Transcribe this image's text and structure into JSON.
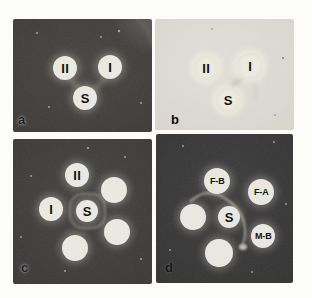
{
  "figure": {
    "panels": [
      {
        "id": "a",
        "label": "a",
        "background": "#3e3c39",
        "well_fill": "#e9e8e1",
        "letter_color": "#1d1d1d",
        "wells": [
          {
            "label": "II",
            "x": 52,
            "y": 49,
            "r": 12
          },
          {
            "label": "I",
            "x": 97,
            "y": 48,
            "r": 12
          },
          {
            "label": "S",
            "x": 72,
            "y": 79,
            "r": 12
          }
        ],
        "arcs": [
          {
            "tag": "path",
            "attrs": {
              "d": "M 57 60 Q 64 69 70 72",
              "stroke": "#85837a",
              "stroke-width": "5",
              "fill": "none",
              "opacity": "0.5",
              "filter": "url(#soft2)"
            }
          },
          {
            "tag": "path",
            "attrs": {
              "d": "M 92 59 Q 85 69 78 72",
              "stroke": "#85837a",
              "stroke-width": "5",
              "fill": "none",
              "opacity": "0.5",
              "filter": "url(#soft2)"
            }
          },
          {
            "tag": "path",
            "attrs": {
              "d": "M 122 0 Q 137 7 139 27",
              "stroke": "#75736c",
              "stroke-width": "3",
              "fill": "none",
              "opacity": "0.6",
              "filter": "url(#soft2)"
            }
          }
        ]
      },
      {
        "id": "b",
        "label": "b",
        "background": "#d9d6cd",
        "well_fill": "#edebdf",
        "letter_color": "#0f0f0f",
        "wells": [
          {
            "label": "II",
            "x": 51,
            "y": 49,
            "r": 12
          },
          {
            "label": "I",
            "x": 95,
            "y": 47,
            "r": 13
          },
          {
            "label": "S",
            "x": 73,
            "y": 81,
            "r": 12
          }
        ],
        "arcs": [
          {
            "tag": "path",
            "attrs": {
              "d": "M 90 58 Q 80 62 76 70",
              "stroke": "#a09e94",
              "stroke-width": "4",
              "fill": "none",
              "opacity": "0.55",
              "filter": "url(#soft2)"
            }
          },
          {
            "tag": "path",
            "attrs": {
              "d": "M 96 60 Q 104 70 100 80",
              "stroke": "#c2c0b6",
              "stroke-width": "3",
              "fill": "none",
              "opacity": "0.4",
              "filter": "url(#soft2)"
            }
          }
        ]
      },
      {
        "id": "c",
        "label": "c",
        "background": "#3b3a38",
        "well_fill": "#e9e8e1",
        "letter_color": "#1d1d1d",
        "wells": [
          {
            "label": "II",
            "x": 64,
            "y": 36,
            "r": 12
          },
          {
            "label": "",
            "x": 101,
            "y": 51,
            "r": 13
          },
          {
            "label": "I",
            "x": 38,
            "y": 70,
            "r": 12
          },
          {
            "label": "S",
            "x": 74,
            "y": 72,
            "r": 11
          },
          {
            "label": "",
            "x": 104,
            "y": 93,
            "r": 13
          },
          {
            "label": "",
            "x": 62,
            "y": 109,
            "r": 13
          }
        ],
        "arcs": [
          {
            "tag": "rect",
            "attrs": {
              "x": "57",
              "y": "55",
              "width": "35",
              "height": "34",
              "rx": "13",
              "stroke": "#93918a",
              "stroke-width": "2.5",
              "fill": "none",
              "opacity": "0.55",
              "filter": "url(#soft1)"
            }
          },
          {
            "tag": "path",
            "attrs": {
              "d": "M 52 92 Q 62 97 74 95",
              "stroke": "#7c7a73",
              "stroke-width": "3",
              "fill": "none",
              "opacity": "0.35",
              "filter": "url(#soft2)"
            }
          }
        ]
      },
      {
        "id": "d",
        "label": "d",
        "background": "#353434",
        "well_fill": "#e8e7e0",
        "letter_color": "#161616",
        "wells": [
          {
            "label": "F-B",
            "x": 61,
            "y": 47,
            "r": 13
          },
          {
            "label": "F-A",
            "x": 105,
            "y": 58,
            "r": 13
          },
          {
            "label": "",
            "x": 37,
            "y": 83,
            "r": 13
          },
          {
            "label": "S",
            "x": 73,
            "y": 83,
            "r": 11
          },
          {
            "label": "M-B",
            "x": 107,
            "y": 102,
            "r": 12
          },
          {
            "label": "",
            "x": 63,
            "y": 119,
            "r": 14
          }
        ],
        "arcs": [
          {
            "tag": "path",
            "attrs": {
              "d": "M 34 68 C 45 57 57 57 67 63 C 77 69 85 77 88 88 C 90 97 89 106 86 112",
              "stroke": "#aba89f",
              "stroke-width": "2.2",
              "fill": "none",
              "opacity": "0.8",
              "filter": "url(#soft1)"
            }
          },
          {
            "tag": "ellipse",
            "attrs": {
              "cx": "87",
              "cy": "113",
              "rx": "4",
              "ry": "3",
              "fill": "#dad7cc",
              "opacity": "0.85",
              "filter": "url(#soft1)"
            }
          }
        ]
      }
    ]
  }
}
